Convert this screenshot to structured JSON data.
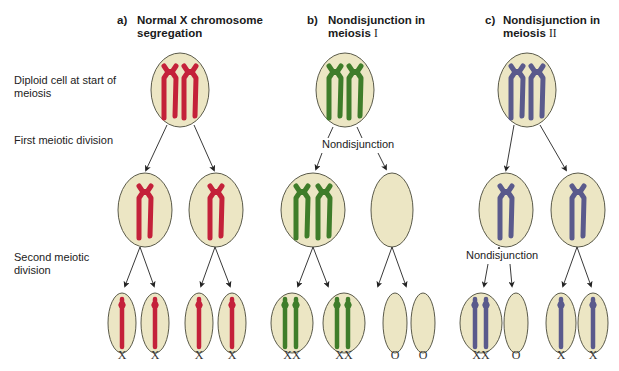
{
  "panels": [
    {
      "letter": "a)",
      "title_line1": "Normal X chromosome",
      "title_line2": "segregation",
      "chromosome_color": "#c4213a"
    },
    {
      "letter": "b)",
      "title_line1": "Nondisjunction in",
      "title_line2_text": "meiosis ",
      "title_line2_roman": "I",
      "chromosome_color": "#3f7d2a"
    },
    {
      "letter": "c)",
      "title_line1": "Nondisjunction in",
      "title_line2_text": "meiosis ",
      "title_line2_roman": "II",
      "chromosome_color": "#5a5a8c"
    }
  ],
  "row_labels": {
    "diploid_line1": "Diploid cell at start of",
    "diploid_line2": "meiosis",
    "first_division": "First meiotic division",
    "second_line1": "Second meiotic",
    "second_line2": "division"
  },
  "nondisjunction_labels": {
    "b": "Nondisjunction",
    "c": "Nondisjunction"
  },
  "gametes": {
    "a": [
      "X",
      "X",
      "X",
      "X"
    ],
    "b": [
      "XX",
      "XX",
      "O",
      "O"
    ],
    "c": [
      "XX",
      "O",
      "X",
      "X"
    ]
  },
  "colors": {
    "cell_fill": "#ece6c4",
    "cell_stroke": "#5a5a4a",
    "red": "#c4213a",
    "green": "#3f7d2a",
    "purple": "#5a5a8c",
    "arrow": "#222222"
  }
}
